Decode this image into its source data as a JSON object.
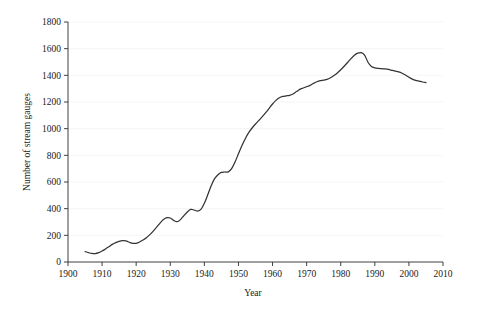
{
  "chart_data": {
    "type": "line",
    "title": "",
    "subtitle": "",
    "xlabel": "Year",
    "ylabel": "Number of stream gauges",
    "xlim": [
      1900,
      2010
    ],
    "ylim": [
      0,
      1800
    ],
    "xticks": [
      1900,
      1910,
      1920,
      1930,
      1940,
      1950,
      1960,
      1970,
      1980,
      1990,
      2000,
      2010
    ],
    "yticks": [
      0,
      200,
      400,
      600,
      800,
      1000,
      1200,
      1400,
      1600,
      1800
    ],
    "xtick_labels": [
      "1900",
      "1910",
      "1920",
      "1930",
      "1940",
      "1950",
      "1960",
      "1970",
      "1980",
      "1990",
      "2000",
      "2010"
    ],
    "ytick_labels": [
      "0",
      "200",
      "400",
      "600",
      "800",
      "1000",
      "1200",
      "1400",
      "1600",
      "1800"
    ],
    "grid": "faint-horizontal",
    "legend": "none",
    "line_color": "#333333",
    "line_width": 1.25,
    "series": [
      {
        "name": "Number of stream gauges",
        "x": [
          1905,
          1906,
          1907,
          1908,
          1909,
          1910,
          1911,
          1912,
          1913,
          1914,
          1915,
          1916,
          1917,
          1918,
          1919,
          1920,
          1921,
          1922,
          1923,
          1924,
          1925,
          1926,
          1927,
          1928,
          1929,
          1930,
          1931,
          1932,
          1933,
          1934,
          1935,
          1936,
          1937,
          1938,
          1939,
          1940,
          1941,
          1942,
          1943,
          1944,
          1945,
          1946,
          1947,
          1948,
          1949,
          1950,
          1951,
          1952,
          1953,
          1954,
          1955,
          1956,
          1957,
          1958,
          1959,
          1960,
          1961,
          1962,
          1963,
          1964,
          1965,
          1966,
          1967,
          1968,
          1969,
          1970,
          1971,
          1972,
          1973,
          1974,
          1975,
          1976,
          1977,
          1978,
          1979,
          1980,
          1981,
          1982,
          1983,
          1984,
          1985,
          1986,
          1987,
          1988,
          1989,
          1990,
          1991,
          1992,
          1993,
          1994,
          1995,
          1996,
          1997,
          1998,
          1999,
          2000,
          2001,
          2002,
          2003,
          2004,
          2005
        ],
        "y": [
          75,
          68,
          62,
          62,
          68,
          80,
          95,
          112,
          128,
          140,
          152,
          158,
          160,
          150,
          142,
          140,
          148,
          160,
          175,
          195,
          218,
          245,
          272,
          300,
          320,
          330,
          310,
          300,
          318,
          345,
          370,
          395,
          390,
          380,
          390,
          430,
          500,
          570,
          620,
          655,
          670,
          675,
          672,
          690,
          740,
          800,
          860,
          910,
          960,
          1000,
          1030,
          1060,
          1090,
          1120,
          1150,
          1185,
          1215,
          1235,
          1245,
          1248,
          1250,
          1258,
          1275,
          1290,
          1300,
          1310,
          1320,
          1335,
          1350,
          1358,
          1362,
          1365,
          1375,
          1390,
          1410,
          1435,
          1460,
          1490,
          1520,
          1548,
          1565,
          1570,
          1555,
          1500,
          1465,
          1455,
          1450,
          1448,
          1445,
          1440,
          1435,
          1430,
          1425,
          1415,
          1400,
          1385,
          1370,
          1360,
          1355,
          1350,
          1345
        ]
      }
    ],
    "series_extended_note": "",
    "data_points_detail": {
      "start_year": 1905,
      "start_value": 75,
      "peak_year": 1969,
      "peak_value": 1570,
      "end_year": 2005,
      "end_value": 1215
    }
  },
  "curve": {
    "points": [
      [
        1905,
        78
      ],
      [
        1906,
        70
      ],
      [
        1907,
        64
      ],
      [
        1908,
        63
      ],
      [
        1909,
        70
      ],
      [
        1910,
        82
      ],
      [
        1911,
        98
      ],
      [
        1912,
        115
      ],
      [
        1913,
        132
      ],
      [
        1914,
        145
      ],
      [
        1915,
        155
      ],
      [
        1916,
        160
      ],
      [
        1917,
        158
      ],
      [
        1918,
        148
      ],
      [
        1919,
        140
      ],
      [
        1920,
        140
      ],
      [
        1921,
        150
      ],
      [
        1922,
        165
      ],
      [
        1923,
        182
      ],
      [
        1924,
        205
      ],
      [
        1925,
        232
      ],
      [
        1926,
        262
      ],
      [
        1927,
        292
      ],
      [
        1928,
        318
      ],
      [
        1929,
        332
      ],
      [
        1930,
        330
      ],
      [
        1931,
        312
      ],
      [
        1932,
        302
      ],
      [
        1933,
        318
      ],
      [
        1934,
        348
      ],
      [
        1935,
        375
      ],
      [
        1936,
        394
      ],
      [
        1937,
        390
      ],
      [
        1938,
        382
      ],
      [
        1939,
        395
      ],
      [
        1940,
        440
      ],
      [
        1941,
        505
      ],
      [
        1942,
        572
      ],
      [
        1943,
        625
      ],
      [
        1944,
        655
      ],
      [
        1945,
        672
      ],
      [
        1946,
        675
      ],
      [
        1947,
        676
      ],
      [
        1948,
        700
      ],
      [
        1949,
        750
      ],
      [
        1950,
        812
      ],
      [
        1951,
        872
      ],
      [
        1952,
        925
      ],
      [
        1953,
        970
      ],
      [
        1954,
        1005
      ],
      [
        1955,
        1035
      ],
      [
        1956,
        1062
      ],
      [
        1957,
        1090
      ],
      [
        1958,
        1120
      ],
      [
        1959,
        1152
      ],
      [
        1960,
        1185
      ],
      [
        1961,
        1212
      ],
      [
        1962,
        1232
      ],
      [
        1963,
        1242
      ],
      [
        1964,
        1246
      ],
      [
        1965,
        1250
      ],
      [
        1966,
        1260
      ],
      [
        1967,
        1278
      ],
      [
        1968,
        1295
      ],
      [
        1969,
        1305
      ],
      [
        1970,
        1315
      ],
      [
        1971,
        1325
      ],
      [
        1972,
        1340
      ],
      [
        1973,
        1352
      ],
      [
        1974,
        1360
      ],
      [
        1975,
        1364
      ],
      [
        1976,
        1370
      ],
      [
        1977,
        1382
      ],
      [
        1978,
        1398
      ],
      [
        1979,
        1418
      ],
      [
        1980,
        1442
      ],
      [
        1981,
        1468
      ],
      [
        1982,
        1496
      ],
      [
        1983,
        1525
      ],
      [
        1984,
        1550
      ],
      [
        1985,
        1566
      ],
      [
        1986,
        1570
      ],
      [
        1987,
        1552
      ],
      [
        1988,
        1498
      ],
      [
        1989,
        1466
      ],
      [
        1990,
        1456
      ],
      [
        1991,
        1452
      ],
      [
        1992,
        1450
      ],
      [
        1993,
        1448
      ],
      [
        1994,
        1444
      ],
      [
        1995,
        1438
      ],
      [
        1996,
        1432
      ],
      [
        1997,
        1426
      ],
      [
        1998,
        1416
      ],
      [
        1999,
        1402
      ],
      [
        2000,
        1386
      ],
      [
        2001,
        1372
      ],
      [
        2002,
        1362
      ],
      [
        2003,
        1356
      ],
      [
        2004,
        1350
      ],
      [
        2005,
        1346
      ]
    ]
  }
}
